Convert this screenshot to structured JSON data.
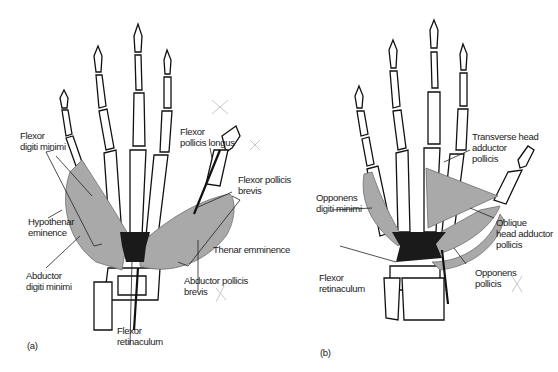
{
  "panels": {
    "a": {
      "panel_label": "(a)",
      "labels": {
        "flexor_digiti_minimi": [
          "Flexor",
          "digiti minimi"
        ],
        "hypothenar_eminence": [
          "Hypothenar",
          "eminence"
        ],
        "abductor_digiti_minimi": [
          "Abductor",
          "digiti minimi"
        ],
        "flexor_pollicis_longus": [
          "Flexor",
          "pollicis longus"
        ],
        "flexor_pollicis_brevis": [
          "Flexor pollicis",
          "brevis"
        ],
        "thenar_eminence": [
          "Thenar emminence"
        ],
        "abductor_pollicis_brevis": [
          "Abductor pollicis",
          "brevis"
        ],
        "flexor_retinaculum": [
          "Flexor",
          "retinaculum"
        ]
      }
    },
    "b": {
      "panel_label": "(b)",
      "labels": {
        "transverse_head_adductor_pollicis": [
          "Transverse head",
          "adductor",
          "pollicis"
        ],
        "opponens_digiti_minimi": [
          "Opponens",
          "digiti minimi"
        ],
        "oblique_head_adductor_pollicis": [
          "Oblique",
          "head adductor",
          "pollicis"
        ],
        "flexor_retinaculum": [
          "Flexor",
          "retinaculum"
        ],
        "opponens_pollicis": [
          "Opponens",
          "pollicis"
        ]
      }
    }
  },
  "colors": {
    "muscle_fill": "#a9a9a9",
    "bone_outline": "#111111",
    "retinaculum": "#1a1a1a",
    "text": "#1a1a1a"
  }
}
